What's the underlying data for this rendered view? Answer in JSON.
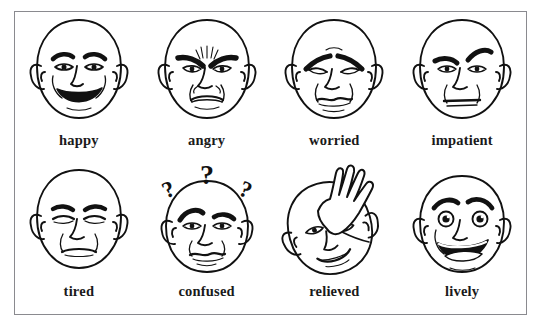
{
  "figure": {
    "type": "illustration-grid",
    "title": "",
    "rows": 2,
    "columns": 4,
    "border_color": "#8a8a8f",
    "background_color": "#ffffff",
    "line_color": "#111111"
  },
  "faces": [
    {
      "id": "happy",
      "label": "happy",
      "row": 1,
      "column": 1,
      "expression": "broad open smile, raised eyebrows, open eyes with pupils, cheek lines",
      "props": []
    },
    {
      "id": "angry",
      "label": "angry",
      "row": 1,
      "column": 2,
      "expression": "heavy furrowed eyebrows slanting inward, creases between brows, downturned frowning mouth",
      "props": []
    },
    {
      "id": "worried",
      "label": "worried",
      "row": 1,
      "column": 3,
      "expression": "eyebrows raised and angled up at inner ends, drooping eyes, wavy closed mouth",
      "props": []
    },
    {
      "id": "impatient",
      "label": "impatient",
      "row": 1,
      "column": 4,
      "expression": "one eyebrow raised high, the other lowered, flat straight mouth",
      "props": []
    },
    {
      "id": "tired",
      "label": "tired",
      "row": 2,
      "column": 1,
      "expression": "droopy half-closed eyes, relaxed eyebrows, flat neutral mouth",
      "props": []
    },
    {
      "id": "confused",
      "label": "confused",
      "row": 2,
      "column": 2,
      "expression": "uneven eyebrows, wavy uncertain mouth",
      "props": [
        "question-mark-left",
        "question-mark-center",
        "question-mark-right"
      ]
    },
    {
      "id": "relieved",
      "label": "relieved",
      "row": 2,
      "column": 3,
      "expression": "head tilted, small relaxed smile, hand wiping the forehead",
      "props": [
        "hand-on-forehead"
      ]
    },
    {
      "id": "lively",
      "label": "lively",
      "row": 2,
      "column": 4,
      "expression": "wide bright eyes with highlights, arched eyebrows, big open laughing mouth",
      "props": []
    }
  ]
}
